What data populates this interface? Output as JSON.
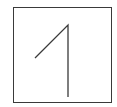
{
  "glyph": {
    "character": "1",
    "description": "hand-drawn digit one inside a square box",
    "stroke_color": "#3a3a3a",
    "box_color": "#3a3a3a"
  }
}
